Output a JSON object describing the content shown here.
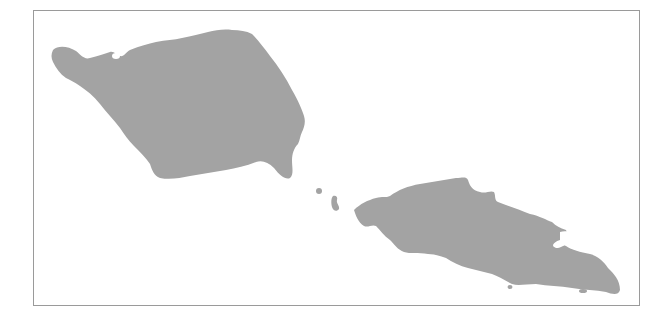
{
  "map": {
    "type": "outline-map",
    "colors": {
      "land": "#a3a3a3",
      "water": "#ffffff",
      "frame": "#9a9a9a"
    },
    "features": [
      {
        "id": "savaii",
        "label": "",
        "kind": "main-island"
      },
      {
        "id": "upolu",
        "label": "",
        "kind": "main-island"
      },
      {
        "id": "apolima",
        "label": "",
        "kind": "islet"
      },
      {
        "id": "manono",
        "label": "",
        "kind": "islet"
      },
      {
        "id": "nuutele",
        "label": "",
        "kind": "islet"
      },
      {
        "id": "south-islet",
        "label": "",
        "kind": "islet"
      }
    ]
  }
}
